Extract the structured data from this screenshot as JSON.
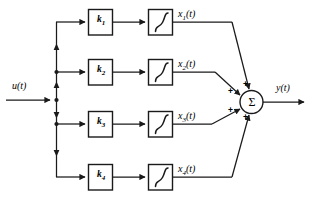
{
  "diagram": {
    "input": {
      "label": "u(t)",
      "variable": "u",
      "arg": "(t)"
    },
    "output": {
      "label": "y(t)",
      "variable": "y",
      "arg": "(t)"
    },
    "sum_node": {
      "glyph": "Σ",
      "signs": [
        "+",
        "+",
        "+",
        "+"
      ]
    },
    "integrator_glyph": "∫",
    "channels": [
      {
        "gain_label": "k",
        "gain_index": "1",
        "integrator_label": "∫",
        "state_label": "x",
        "state_index": "1",
        "state_arg": "(t)",
        "state_full": "x₁(t)"
      },
      {
        "gain_label": "k",
        "gain_index": "2",
        "integrator_label": "∫",
        "state_label": "x",
        "state_index": "2",
        "state_arg": "(t)",
        "state_full": "x₂(t)"
      },
      {
        "gain_label": "k",
        "gain_index": "3",
        "integrator_label": "∫",
        "state_label": "x",
        "state_index": "3",
        "state_arg": "(t)",
        "state_full": "x₃(t)"
      },
      {
        "gain_label": "k",
        "gain_index": "4",
        "integrator_label": "∫",
        "state_label": "x",
        "state_index": "4",
        "state_arg": "(t)",
        "state_full": "x₄(t)"
      }
    ],
    "colors": {
      "line": "#1a1a1a",
      "background": "#ffffff",
      "text": "#111111"
    }
  }
}
